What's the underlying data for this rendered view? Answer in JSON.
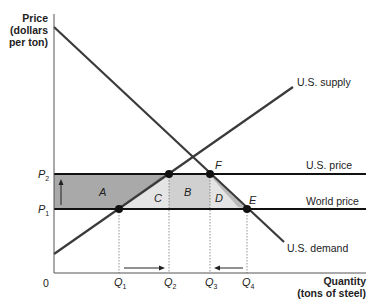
{
  "diagram": {
    "type": "supply-demand-tariff",
    "y_axis": {
      "title_line1": "Price",
      "title_line2": "(dollars",
      "title_line3": "per ton)"
    },
    "x_axis": {
      "title_line1": "Quantity",
      "title_line2": "(tons of steel)",
      "origin_label": "0"
    },
    "price_levels": [
      {
        "id": "P2",
        "letter": "P",
        "sub": "2",
        "line_label": "U.S. price"
      },
      {
        "id": "P1",
        "letter": "P",
        "sub": "1",
        "line_label": "World price"
      }
    ],
    "curves": {
      "supply_label": "U.S. supply",
      "demand_label": "U.S. demand"
    },
    "quantities": [
      {
        "letter": "Q",
        "sub": "1"
      },
      {
        "letter": "Q",
        "sub": "2"
      },
      {
        "letter": "Q",
        "sub": "3"
      },
      {
        "letter": "Q",
        "sub": "4"
      }
    ],
    "areas": {
      "A": "A",
      "B": "B",
      "C": "C",
      "D": "D"
    },
    "points": {
      "E": "E",
      "F": "F"
    },
    "colors": {
      "area_A": "#a9a9a9",
      "area_B": "#d0d0d0",
      "area_C": "#e4e4e4",
      "area_D": "#e4e4e4",
      "lines": "#3a3a3a",
      "price_lines": "#111111"
    }
  }
}
